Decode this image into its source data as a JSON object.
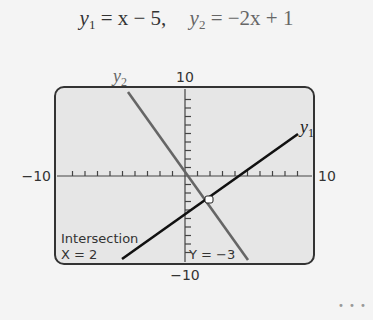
{
  "title": {
    "eq1_lhs": "y",
    "eq1_sub": "1",
    "eq1_rhs": " = x − 5,",
    "eq2_lhs": "y",
    "eq2_sub": "2",
    "eq2_rhs": " = −2x + 1"
  },
  "labels": {
    "y2_label": "y",
    "y2_sub": "2",
    "y1_label": "y",
    "y1_sub": "1",
    "ymax": "10",
    "ymin": "−10",
    "xmin": "−10",
    "xmax": "10",
    "intersection_title": "Intersection",
    "intersection_x": "X = 2",
    "intersection_y": "Y = −3"
  },
  "footer": {
    "dots": "• • •"
  },
  "colors": {
    "screen_bg": "#e6e6e6",
    "frame": "#333333",
    "y1_line": "#111111",
    "y2_line": "#666666",
    "axis": "#444444"
  },
  "chart_data": {
    "type": "line",
    "title": "y1 = x − 5,  y2 = −2x + 1",
    "xlabel": "",
    "ylabel": "",
    "xlim": [
      -10,
      10
    ],
    "ylim": [
      -10,
      10
    ],
    "x_ticks_every": 1,
    "y_ticks_every": 1,
    "grid": false,
    "series": [
      {
        "name": "y1",
        "equation": "y = x - 5",
        "x": [
          -5,
          9
        ],
        "values": [
          -10,
          4
        ]
      },
      {
        "name": "y2",
        "equation": "y = -2x + 1",
        "x": [
          -4.5,
          5.5
        ],
        "values": [
          10,
          -10
        ]
      }
    ],
    "annotations": [
      {
        "text": "Intersection X = 2 Y = -3",
        "x": 2,
        "y": -3
      }
    ]
  }
}
